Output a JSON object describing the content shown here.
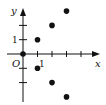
{
  "diagram": {
    "type": "coordinate-plane-scatter",
    "axes": {
      "x_label": "x",
      "y_label": "y",
      "origin_label": "O",
      "x_unit_label": "1",
      "y_unit_label": "1",
      "x_ticks": [
        1,
        2,
        3,
        4
      ],
      "y_ticks": [
        -2,
        -1,
        1,
        2
      ]
    },
    "points": [
      {
        "x": 0,
        "y": 0
      },
      {
        "x": 1,
        "y": 1
      },
      {
        "x": 2,
        "y": 2
      },
      {
        "x": 3,
        "y": 3
      },
      {
        "x": 1,
        "y": -1
      },
      {
        "x": 2,
        "y": -2
      },
      {
        "x": 3,
        "y": -3
      }
    ],
    "colors": {
      "ink": "#111111",
      "background": "#ffffff"
    }
  }
}
